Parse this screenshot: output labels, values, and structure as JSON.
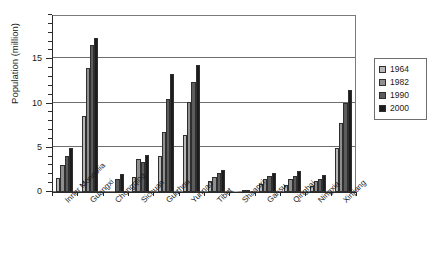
{
  "chart_data": {
    "type": "bar",
    "title": "",
    "xlabel": "",
    "ylabel": "Population (million)",
    "ylim": [
      0,
      20
    ],
    "yticks": [
      0,
      5,
      10,
      15
    ],
    "ytick_labels": [
      "0",
      "5",
      "10",
      "15"
    ],
    "minor_tick_step": 1,
    "grid": true,
    "grid_axis": "y",
    "legend_position": "right",
    "categories": [
      "Inner Mongolia",
      "Guangxi",
      "Chongqing",
      "Sichuan",
      "Guizhou",
      "Yunnan",
      "Tibet",
      "Shaanxi",
      "Gansu",
      "Qinghai",
      "Ningxia",
      "Xinjiang"
    ],
    "series": [
      {
        "name": "1964",
        "color": "#b7b7b7",
        "values": [
          1.6,
          8.6,
          0.0,
          1.7,
          4.1,
          6.4,
          1.2,
          0.05,
          0.9,
          0.8,
          0.7,
          5.0
        ]
      },
      {
        "name": "1982",
        "color": "#8f8f8f",
        "values": [
          3.0,
          14.0,
          0.0,
          3.7,
          6.8,
          10.2,
          1.7,
          0.1,
          1.5,
          1.5,
          1.2,
          7.8
        ]
      },
      {
        "name": "1990",
        "color": "#5c5c5c",
        "values": [
          4.1,
          16.6,
          1.5,
          3.4,
          10.5,
          12.4,
          2.2,
          0.15,
          1.8,
          1.8,
          1.5,
          10.1
        ]
      },
      {
        "name": "2000",
        "color": "#1c1c1c",
        "values": [
          5.0,
          17.4,
          2.0,
          4.2,
          13.3,
          14.4,
          2.5,
          0.2,
          2.2,
          2.4,
          1.9,
          11.5
        ]
      }
    ]
  },
  "axis": {
    "y_title": "Population (million)"
  },
  "legend": {
    "items": [
      {
        "label": "1964",
        "color": "#b7b7b7"
      },
      {
        "label": "1982",
        "color": "#8f8f8f"
      },
      {
        "label": "1990",
        "color": "#5c5c5c"
      },
      {
        "label": "2000",
        "color": "#1c1c1c"
      }
    ]
  },
  "top_caption": {
    "text": ""
  }
}
